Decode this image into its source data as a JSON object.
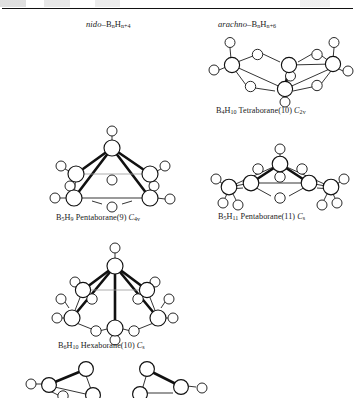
{
  "figure": {
    "columns": [
      {
        "name": "nido-column",
        "prefix": "nido",
        "dash": "–",
        "formula_b": "B",
        "sub_b": "n",
        "formula_h": "H",
        "sub_h": "n+4"
      },
      {
        "name": "arachno-column",
        "prefix": "arachno",
        "dash": "–",
        "formula_b": "B",
        "sub_b": "n",
        "formula_h": "H",
        "sub_h": "n+6"
      }
    ],
    "structures": [
      {
        "id": "b4h10",
        "caption_formula_b": "B",
        "caption_sub_b": "4",
        "caption_formula_h": "H",
        "caption_sub_h": "10",
        "caption_name": "Tetraborane(10)",
        "point_group": "C",
        "point_group_sub": "2v",
        "class": "arachno",
        "boron_count": 4,
        "geometry": "butterfly / folded chain"
      },
      {
        "id": "b5h9",
        "caption_formula_b": "B",
        "caption_sub_b": "5",
        "caption_formula_h": "H",
        "caption_sub_h": "9",
        "caption_name": "Pentaborane(9)",
        "point_group": "C",
        "point_group_sub": "4v",
        "class": "nido",
        "boron_count": 5,
        "geometry": "square pyramid"
      },
      {
        "id": "b5h11",
        "caption_formula_b": "B",
        "caption_sub_b": "5",
        "caption_formula_h": "H",
        "caption_sub_h": "11",
        "caption_name": "Pentaborane(11)",
        "point_group": "C",
        "point_group_sub": "s",
        "class": "arachno",
        "boron_count": 5,
        "geometry": "open pyramid"
      },
      {
        "id": "b6h10",
        "caption_formula_b": "B",
        "caption_sub_b": "6",
        "caption_formula_h": "H",
        "caption_sub_h": "10",
        "caption_name": "Hexaborane(10)",
        "point_group": "C",
        "point_group_sub": "s",
        "class": "nido",
        "boron_count": 6,
        "geometry": "pentagonal pyramid"
      }
    ],
    "cropped_structures": [
      {
        "id": "bottom-left-partial",
        "note": "cut off at page edge"
      },
      {
        "id": "bottom-right-partial",
        "note": "cut off at page edge"
      }
    ]
  }
}
